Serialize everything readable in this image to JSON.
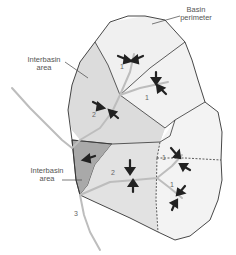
{
  "diagram": {
    "type": "drainage-basin-stream-order",
    "labels": {
      "basin_perimeter_line1": "Basin",
      "basin_perimeter_line2": "perimeter",
      "interbasin_top_line1": "Interbasin",
      "interbasin_top_line2": "area",
      "interbasin_bottom_line1": "Interbasin",
      "interbasin_bottom_line2": "area"
    },
    "stream_orders": {
      "top_left_subbasin": "1",
      "top_right_subbasin": "1",
      "upper_order2": "2",
      "right_upper_subbasin": "1",
      "right_lower_subbasin": "1",
      "lower_order2": "2",
      "outlet_order3": "3"
    },
    "colors": {
      "interbasin_top": "#d4d4d4",
      "interbasin_bottom": "#a8a8a8",
      "order2_basin": "#e4e4e4",
      "order1_basin": "#f0f0f0",
      "stream": "#b8b8b8",
      "boundary": "#333333",
      "arrow": "#222222"
    }
  }
}
